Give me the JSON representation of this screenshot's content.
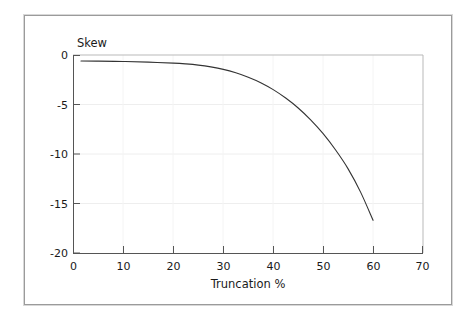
{
  "figure": {
    "background_color": "#ffffff",
    "frame_color": "#9b9b9b"
  },
  "chart_data": {
    "type": "line",
    "title": "",
    "xlabel": "Truncation %",
    "ylabel": "Skew",
    "xlim": [
      0,
      70
    ],
    "ylim": [
      -20,
      0
    ],
    "xticks": [
      0,
      10,
      20,
      30,
      40,
      50,
      60,
      70
    ],
    "xtick_labels": [
      "0",
      "10",
      "20",
      "30",
      "40",
      "50",
      "60",
      "70"
    ],
    "yticks": [
      0,
      -5,
      -10,
      -15,
      -20
    ],
    "ytick_labels": [
      "0",
      "-5",
      "-10",
      "-15",
      "-20"
    ],
    "grid": "horizontal-faint",
    "legend": "none",
    "line_color": "#333333",
    "line_width": 1.1,
    "series": [
      {
        "name": "Skew vs Truncation",
        "x": [
          1.5,
          5,
          10,
          15,
          20,
          22.5,
          25,
          27.5,
          30,
          32.5,
          35,
          37.5,
          40,
          42.5,
          45,
          47.5,
          50,
          52.5,
          55,
          57.5,
          60
        ],
        "y": [
          -0.6,
          -0.62,
          -0.66,
          -0.72,
          -0.82,
          -0.9,
          -1.02,
          -1.2,
          -1.45,
          -1.8,
          -2.25,
          -2.8,
          -3.5,
          -4.35,
          -5.35,
          -6.55,
          -7.95,
          -9.6,
          -11.5,
          -13.85,
          -16.7
        ]
      }
    ]
  }
}
